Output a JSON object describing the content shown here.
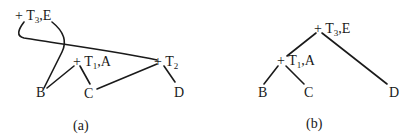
{
  "panels": [
    {
      "caption": "(a)",
      "nodes": {
        "t3": {
          "plus": "+",
          "t": "T",
          "sub": "3",
          "rest": ",E"
        },
        "t1": {
          "plus": "+",
          "t": "T",
          "sub": "1",
          "rest": ",A"
        },
        "t2": {
          "plus": "+",
          "t": "T",
          "sub": "2",
          "rest": ""
        },
        "b": "B",
        "c": "C",
        "d": "D"
      },
      "edges": [
        [
          "T3,E",
          "T2"
        ],
        [
          "T3,E",
          "B"
        ],
        [
          "T1,A",
          "B"
        ],
        [
          "T1,A",
          "C"
        ],
        [
          "T2",
          "C"
        ],
        [
          "T2",
          "D"
        ]
      ]
    },
    {
      "caption": "(b)",
      "nodes": {
        "t3": {
          "plus": "+",
          "t": "T",
          "sub": "3",
          "rest": ",E"
        },
        "t1": {
          "plus": "+",
          "t": "T",
          "sub": "1",
          "rest": ",A"
        },
        "b": "B",
        "c": "C",
        "d": "D"
      },
      "edges": [
        [
          "T3,E",
          "T1,A"
        ],
        [
          "T3,E",
          "D"
        ],
        [
          "T1,A",
          "B"
        ],
        [
          "T1,A",
          "C"
        ]
      ]
    }
  ]
}
